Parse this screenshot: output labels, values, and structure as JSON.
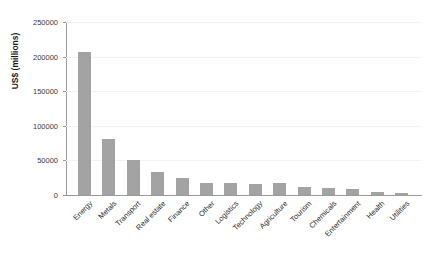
{
  "chart_data": {
    "type": "bar",
    "title": "",
    "xlabel": "",
    "ylabel": "US$ (millions)",
    "ylim": [
      0,
      250000
    ],
    "grid": true,
    "legend": "none",
    "bar_color": "#a3a3a3",
    "axis_color": "#9a9a9a",
    "gridline_color": "#f2f2f2",
    "ytick_labels": [
      "0",
      "50000",
      "100000",
      "150000",
      "200000",
      "250000"
    ],
    "ytick_values": [
      0,
      50000,
      100000,
      150000,
      200000,
      250000
    ],
    "categories": [
      "Energy",
      "Metals",
      "Transport",
      "Real estate",
      "Finance",
      "Other",
      "Logistics",
      "Technology",
      "Agriculture",
      "Tourism",
      "Chemicals",
      "Entertainment",
      "Health",
      "Utilities"
    ],
    "values": [
      207000,
      81000,
      50000,
      33000,
      24000,
      18000,
      17000,
      16000,
      17000,
      11000,
      10000,
      8000,
      5000,
      3500
    ]
  }
}
